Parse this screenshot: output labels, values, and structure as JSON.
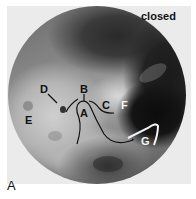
{
  "figure": {
    "panel_label": "A",
    "state_label": "closed",
    "anatomical_labels": [
      {
        "id": "A",
        "color": "dark"
      },
      {
        "id": "B",
        "color": "dark"
      },
      {
        "id": "C",
        "color": "dark"
      },
      {
        "id": "D",
        "color": "dark"
      },
      {
        "id": "E",
        "color": "dark"
      },
      {
        "id": "F",
        "color": "white"
      },
      {
        "id": "G",
        "color": "white"
      }
    ]
  }
}
